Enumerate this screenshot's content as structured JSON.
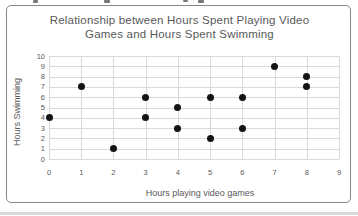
{
  "chart_data": {
    "type": "scatter",
    "title": "Relationship between Hours Spent Playing Video Games and Hours Spent Swimming",
    "title_lines": [
      "Relationship between Hours Spent Playing Video",
      "Games and Hours Spent Swimming"
    ],
    "xlabel": "Hours playing video games",
    "ylabel": "Hours Swimming",
    "xlim": [
      0,
      9
    ],
    "ylim": [
      0,
      10
    ],
    "x_ticks": [
      0,
      1,
      2,
      3,
      4,
      5,
      6,
      7,
      8,
      9
    ],
    "y_ticks": [
      0,
      1,
      2,
      3,
      4,
      5,
      6,
      7,
      8,
      9,
      10
    ],
    "grid": true,
    "legend": "none",
    "points": [
      {
        "x": 0,
        "y": 4
      },
      {
        "x": 1,
        "y": 7
      },
      {
        "x": 2,
        "y": 1
      },
      {
        "x": 3,
        "y": 4
      },
      {
        "x": 3,
        "y": 6
      },
      {
        "x": 4,
        "y": 3
      },
      {
        "x": 4,
        "y": 5
      },
      {
        "x": 5,
        "y": 2
      },
      {
        "x": 5,
        "y": 6
      },
      {
        "x": 6,
        "y": 3
      },
      {
        "x": 6,
        "y": 6
      },
      {
        "x": 7,
        "y": 9
      },
      {
        "x": 8,
        "y": 7
      },
      {
        "x": 8,
        "y": 8
      }
    ],
    "colors": {
      "point": "#141414",
      "gridline": "#d9d9d9",
      "text": "#595959",
      "frame_border": "#868686",
      "background": "#ffffff"
    }
  }
}
